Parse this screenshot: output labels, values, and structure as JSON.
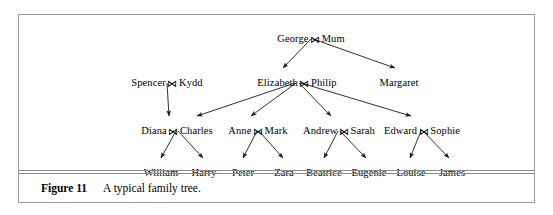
{
  "figure": {
    "caption_label": "Figure 11",
    "caption_text": "A typical family tree.",
    "marriage_symbol": "⋈",
    "border_color": "#9a9a9a",
    "rule_color": "#8c8c8c",
    "line_color": "#1a1a1a",
    "background": "#ffffff"
  },
  "tree": {
    "generations": [
      {
        "level": 1,
        "nodes": [
          {
            "id": "george-mum",
            "left": "George",
            "right": "Mum",
            "married": true,
            "x": 292,
            "y": 18
          }
        ]
      },
      {
        "level": 2,
        "nodes": [
          {
            "id": "spencer-kydd",
            "left": "Spencer",
            "right": "Kydd",
            "married": true,
            "x": 148,
            "y": 62
          },
          {
            "id": "elizabeth-philip",
            "left": "Elizabeth",
            "right": "Philip",
            "married": true,
            "x": 278,
            "y": 62
          },
          {
            "id": "margaret",
            "left": "Margaret",
            "right": "",
            "married": false,
            "x": 380,
            "y": 62
          }
        ]
      },
      {
        "level": 3,
        "nodes": [
          {
            "id": "diana-charles",
            "left": "Diana",
            "right": "Charles",
            "married": true,
            "x": 158,
            "y": 110
          },
          {
            "id": "anne-mark",
            "left": "Anne",
            "right": "Mark",
            "married": true,
            "x": 239,
            "y": 110
          },
          {
            "id": "andrew-sarah",
            "left": "Andrew",
            "right": "Sarah",
            "married": true,
            "x": 320,
            "y": 110
          },
          {
            "id": "edward-sophie",
            "left": "Edward",
            "right": "Sophie",
            "married": true,
            "x": 403,
            "y": 110
          }
        ]
      },
      {
        "level": 4,
        "nodes": [
          {
            "id": "william",
            "left": "William",
            "right": "",
            "married": false,
            "x": 142,
            "y": 152
          },
          {
            "id": "harry",
            "left": "Harry",
            "right": "",
            "married": false,
            "x": 185,
            "y": 152
          },
          {
            "id": "peter",
            "left": "Peter",
            "right": "",
            "married": false,
            "x": 224,
            "y": 152
          },
          {
            "id": "zara",
            "left": "Zara",
            "right": "",
            "married": false,
            "x": 265,
            "y": 152
          },
          {
            "id": "beatrice",
            "left": "Beatrice",
            "right": "",
            "married": false,
            "x": 305,
            "y": 152
          },
          {
            "id": "eugenie",
            "left": "Eugenie",
            "right": "",
            "married": false,
            "x": 350,
            "y": 152
          },
          {
            "id": "louise",
            "left": "Louise",
            "right": "",
            "married": false,
            "x": 392,
            "y": 152
          },
          {
            "id": "james",
            "left": "James",
            "right": "",
            "married": false,
            "x": 433,
            "y": 152
          }
        ]
      }
    ],
    "edges": [
      {
        "from": "george-mum",
        "to": "elizabeth-philip",
        "x1": 292,
        "y1": 24,
        "x2": 264,
        "y2": 53
      },
      {
        "from": "george-mum",
        "to": "margaret",
        "x1": 294,
        "y1": 24,
        "x2": 376,
        "y2": 53
      },
      {
        "from": "spencer-kydd",
        "to": "diana-charles",
        "x1": 148,
        "y1": 68,
        "x2": 150,
        "y2": 101
      },
      {
        "from": "elizabeth-philip",
        "to": "diana-charles",
        "x1": 276,
        "y1": 68,
        "x2": 178,
        "y2": 101
      },
      {
        "from": "elizabeth-philip",
        "to": "anne-mark",
        "x1": 277,
        "y1": 68,
        "x2": 232,
        "y2": 101
      },
      {
        "from": "elizabeth-philip",
        "to": "andrew-sarah",
        "x1": 280,
        "y1": 68,
        "x2": 312,
        "y2": 101
      },
      {
        "from": "elizabeth-philip",
        "to": "edward-sophie",
        "x1": 282,
        "y1": 68,
        "x2": 392,
        "y2": 101
      },
      {
        "from": "diana-charles",
        "to": "william",
        "x1": 157,
        "y1": 116,
        "x2": 142,
        "y2": 143
      },
      {
        "from": "diana-charles",
        "to": "harry",
        "x1": 159,
        "y1": 116,
        "x2": 184,
        "y2": 143
      },
      {
        "from": "anne-mark",
        "to": "peter",
        "x1": 238,
        "y1": 116,
        "x2": 224,
        "y2": 143
      },
      {
        "from": "anne-mark",
        "to": "zara",
        "x1": 240,
        "y1": 116,
        "x2": 264,
        "y2": 143
      },
      {
        "from": "andrew-sarah",
        "to": "beatrice",
        "x1": 319,
        "y1": 116,
        "x2": 305,
        "y2": 143
      },
      {
        "from": "andrew-sarah",
        "to": "eugenie",
        "x1": 321,
        "y1": 116,
        "x2": 347,
        "y2": 143
      },
      {
        "from": "edward-sophie",
        "to": "louise",
        "x1": 402,
        "y1": 116,
        "x2": 391,
        "y2": 143
      },
      {
        "from": "edward-sophie",
        "to": "james",
        "x1": 404,
        "y1": 116,
        "x2": 430,
        "y2": 143
      }
    ]
  }
}
